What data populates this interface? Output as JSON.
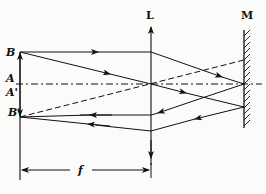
{
  "diagram": {
    "type": "optics-ray-diagram",
    "labels": {
      "lens": "L",
      "mirror": "M",
      "point_B": "B",
      "point_A": "A",
      "point_A_prime": "A'",
      "point_B_prime": "B'",
      "focal_length": "f"
    },
    "colors": {
      "ink": "#111111",
      "background": "#fbfbf9"
    },
    "elements": {
      "optical_axis": "dash-dot",
      "object_arrow": "A to B, upward",
      "image_arrow": "A' to B', downward",
      "lens": "convex lens shown as double-arrow vertical line",
      "mirror": "plane mirror, hatched on right side",
      "rays": [
        "B parallel ray to lens then to mirror center",
        "B chief ray through lens center",
        "reflected rays converging to B'",
        "dashed construction line through lens center"
      ]
    }
  }
}
